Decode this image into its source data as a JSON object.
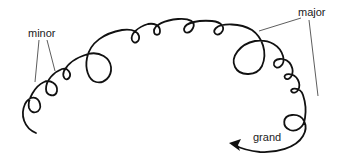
{
  "diagram": {
    "labels": {
      "minor": "minor",
      "major": "major",
      "grand": "grand"
    },
    "colors": {
      "stroke": "#111111",
      "leader": "#333333",
      "background": "#ffffff"
    }
  }
}
